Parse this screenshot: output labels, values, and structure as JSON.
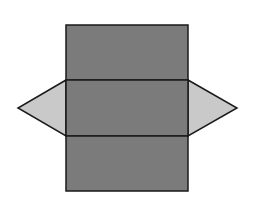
{
  "diagram": {
    "colors": {
      "background": "#ffffff",
      "rect_fill": "#7b7b7b",
      "triangle_fill": "#c9c9c9",
      "stroke": "#1a1a1a"
    },
    "rectangles": [
      {
        "name": "top-face",
        "x": 66,
        "y": 25,
        "w": 122,
        "h": 55
      },
      {
        "name": "middle-face",
        "x": 66,
        "y": 80,
        "w": 122,
        "h": 56
      },
      {
        "name": "bottom-face",
        "x": 66,
        "y": 136,
        "w": 122,
        "h": 55
      }
    ],
    "triangles": [
      {
        "name": "left-triangle-face",
        "points": "66,80 18,108 66,136"
      },
      {
        "name": "right-triangle-face",
        "points": "188,80 237,108 188,136"
      }
    ]
  }
}
